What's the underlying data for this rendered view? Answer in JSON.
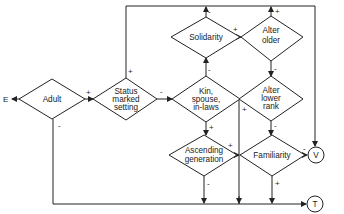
{
  "diagram": {
    "entry_label": "E",
    "nodes": {
      "adult": {
        "lines": [
          "Adult"
        ]
      },
      "status": {
        "lines": [
          "Status",
          "marked",
          "setting"
        ]
      },
      "kin": {
        "lines": [
          "Kin,",
          "spouse,",
          "in-laws"
        ]
      },
      "solidarity": {
        "lines": [
          "Solidarity"
        ]
      },
      "alter_older": {
        "lines": [
          "Alter",
          "older"
        ]
      },
      "alter_lower": {
        "lines": [
          "Alter",
          "lower",
          "rank"
        ]
      },
      "ascending": {
        "lines": [
          "Ascending",
          "generation"
        ]
      },
      "familiarity": {
        "lines": [
          "Familiarity"
        ]
      }
    },
    "terminals": {
      "v": "V",
      "t": "T"
    },
    "signs": {
      "adult_plus": "+",
      "adult_minus": "-",
      "status_plus": "+",
      "status_minus": "-",
      "kin_minus": "-",
      "kin_plus": "+",
      "solidarity_minus": "-",
      "solidarity_plus": "+",
      "alter_older_plus": "+",
      "alter_older_minus": "-",
      "alter_lower_plus": "+",
      "alter_lower_minus": "-",
      "ascending_plus": "+",
      "ascending_minus": "-",
      "familiarity_minus": "-",
      "familiarity_plus": "+"
    }
  }
}
